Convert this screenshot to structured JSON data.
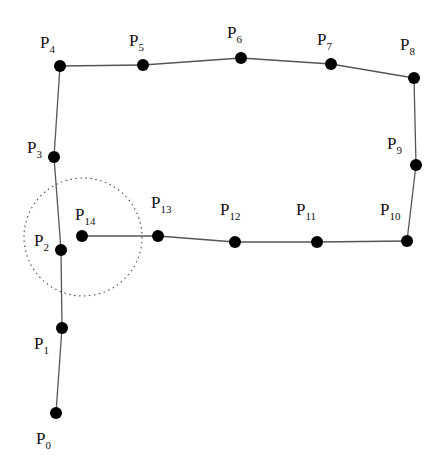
{
  "diagram": {
    "type": "polyline-with-points",
    "points": [
      {
        "name": "P",
        "sub": "0",
        "x": 56,
        "y": 413,
        "lx": 36,
        "ly": 444
      },
      {
        "name": "P",
        "sub": "1",
        "x": 62,
        "y": 328,
        "lx": 34,
        "ly": 349
      },
      {
        "name": "P",
        "sub": "2",
        "x": 61,
        "y": 250,
        "lx": 34,
        "ly": 246
      },
      {
        "name": "P",
        "sub": "3",
        "x": 54,
        "y": 157,
        "lx": 27,
        "ly": 153
      },
      {
        "name": "P",
        "sub": "4",
        "x": 60,
        "y": 66,
        "lx": 40,
        "ly": 48
      },
      {
        "name": "P",
        "sub": "5",
        "x": 143,
        "y": 65,
        "lx": 129,
        "ly": 46
      },
      {
        "name": "P",
        "sub": "6",
        "x": 241,
        "y": 58,
        "lx": 227,
        "ly": 38
      },
      {
        "name": "P",
        "sub": "7",
        "x": 331,
        "y": 64,
        "lx": 317,
        "ly": 45
      },
      {
        "name": "P",
        "sub": "8",
        "x": 414,
        "y": 78,
        "lx": 400,
        "ly": 50
      },
      {
        "name": "P",
        "sub": "9",
        "x": 416,
        "y": 165,
        "lx": 387,
        "ly": 149
      },
      {
        "name": "P",
        "sub": "10",
        "x": 407,
        "y": 241,
        "lx": 380,
        "ly": 215
      },
      {
        "name": "P",
        "sub": "11",
        "x": 317,
        "y": 242,
        "lx": 296,
        "ly": 215
      },
      {
        "name": "P",
        "sub": "12",
        "x": 235,
        "y": 242,
        "lx": 220,
        "ly": 215
      },
      {
        "name": "P",
        "sub": "13",
        "x": 158,
        "y": 236,
        "lx": 151,
        "ly": 208
      },
      {
        "name": "P",
        "sub": "14",
        "x": 82,
        "y": 236,
        "lx": 75,
        "ly": 220
      }
    ],
    "neighborhood_circle": {
      "cx": 83,
      "cy": 237,
      "r": 59,
      "style": "dotted"
    },
    "point_radius": 6,
    "colors": {
      "point": "#000000",
      "edge": "#555555",
      "circle": "#555555",
      "background": "#ffffff"
    }
  }
}
